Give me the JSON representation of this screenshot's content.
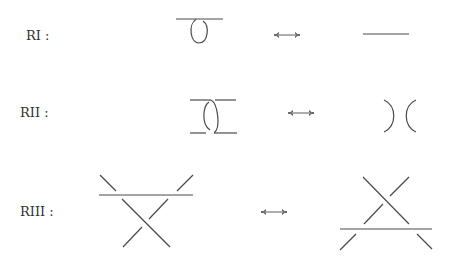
{
  "diagram": {
    "colors": {
      "stroke": "#4a4a4a",
      "text": "#333333",
      "background": "#ffffff"
    },
    "moves": [
      {
        "id": "RI",
        "label": "RI :",
        "left": "curl (kink with one crossing)",
        "relation": "↔",
        "right": "straight strand"
      },
      {
        "id": "RII",
        "label": "RII :",
        "left": "two strands overlapping with two crossings",
        "relation": "↔",
        "right": "two separated arcs"
      },
      {
        "id": "RIII",
        "label": "RIII :",
        "left": "horizontal strand over crossing (above)",
        "relation": "↔",
        "right": "horizontal strand under crossing (below)"
      }
    ]
  }
}
